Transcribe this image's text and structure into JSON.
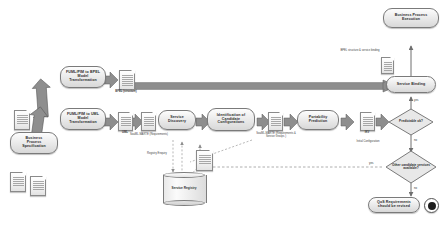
{
  "diagram": {
    "colors": {
      "arrow_fill": "#8e8e8e",
      "arrow_stroke": "#5a5a5a",
      "node_border": "#7a7a7a",
      "text": "#2b2b2b",
      "dashed": "#9a9a9a"
    },
    "activities": [
      {
        "id": "bps",
        "lines": [
          "Business",
          "Process",
          "Specification"
        ]
      },
      {
        "id": "bpel_tr",
        "lines": [
          "FUML/PIM to BPEL",
          "Model",
          "Transformation"
        ]
      },
      {
        "id": "uml_tr",
        "lines": [
          "FUML/PIM to UML",
          "Model",
          "Transformation"
        ]
      },
      {
        "id": "svc_disc",
        "lines": [
          "Service",
          "Discovery"
        ]
      },
      {
        "id": "ident",
        "lines": [
          "Identification of",
          "Candidate",
          "Configurations"
        ]
      },
      {
        "id": "port",
        "lines": [
          "Portability",
          "Prediction"
        ]
      },
      {
        "id": "binding",
        "lines": [
          "Service Binding"
        ]
      },
      {
        "id": "bpexec",
        "lines": [
          "Business Process",
          "Execution"
        ]
      },
      {
        "id": "qos",
        "lines": [
          "QoS Requirements",
          "should be revised"
        ]
      }
    ],
    "decisions": [
      {
        "id": "predictable",
        "lines": [
          "Predictable",
          "ok?"
        ]
      },
      {
        "id": "other_cand",
        "lines": [
          "Other",
          "candidate services",
          "available?"
        ]
      }
    ],
    "datastore": {
      "id": "registry",
      "lines": [
        "Service",
        "Registry"
      ]
    },
    "artifacts": [
      {
        "id": "bpel_doc",
        "caption": [
          "BPEL",
          "(structure)"
        ]
      },
      {
        "id": "uml_doc",
        "caption": [
          "UML"
        ]
      },
      {
        "id": "soaml_doc",
        "caption": [
          "SoaML-MARTE",
          "(Requirements)"
        ]
      },
      {
        "id": "req_doc",
        "caption": [
          "Requirements"
        ]
      },
      {
        "id": "ikv_doc",
        "caption": [
          "IKV"
        ]
      }
    ],
    "annotations": [
      {
        "id": "bpel_binding_note",
        "lines": [
          "BPEL",
          "structure &",
          "service binding"
        ]
      },
      {
        "id": "soaml_marte_note",
        "lines": [
          "SoaML-MARTE",
          "(Requirements &",
          "Service Groups )"
        ]
      },
      {
        "id": "initial_config",
        "lines": [
          "Initial",
          "Configuration"
        ]
      },
      {
        "id": "registry_enquiry",
        "lines": [
          "Registry",
          "Enquiry"
        ]
      },
      {
        "id": "uml_label",
        "lines": [
          "UML"
        ]
      },
      {
        "id": "soaml_label",
        "lines": [
          "SoaML-MARTE",
          "(Requirements)"
        ]
      },
      {
        "id": "bpel_label",
        "lines": [
          "BPEL",
          "(structure)"
        ]
      },
      {
        "id": "ikv_label",
        "lines": [
          "IKV"
        ]
      }
    ],
    "flow_labels": [
      {
        "id": "pred_yes",
        "text": "yes"
      },
      {
        "id": "pred_no",
        "text": "no"
      },
      {
        "id": "other_yes",
        "text": "yes"
      },
      {
        "id": "other_no",
        "text": "no"
      }
    ]
  }
}
